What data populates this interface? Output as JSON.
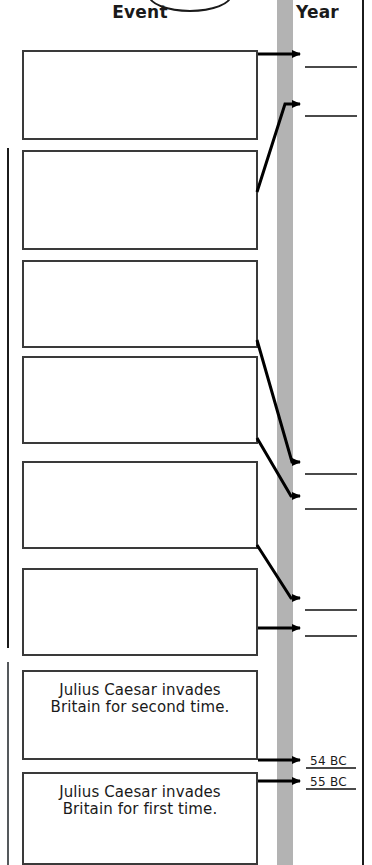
{
  "header": {
    "event_label": "Event",
    "year_label": "Year",
    "oval_icon": "oval-outline-icon"
  },
  "timeline": {
    "bar_color": "#b3b3b3",
    "orientation": "vertical"
  },
  "events": [
    {
      "text": "",
      "top": 50,
      "height": 90,
      "filled": false
    },
    {
      "text": "",
      "top": 150,
      "height": 100,
      "filled": false
    },
    {
      "text": "",
      "top": 260,
      "height": 88,
      "filled": false
    },
    {
      "text": "",
      "top": 356,
      "height": 88,
      "filled": false
    },
    {
      "text": "",
      "top": 461,
      "height": 88,
      "filled": false
    },
    {
      "text": "",
      "top": 568,
      "height": 88,
      "filled": false
    },
    {
      "text": "Julius Caesar invades\nBritain for second time.",
      "top": 670,
      "height": 90,
      "filled": true
    },
    {
      "text": "Julius Caesar invades\nBritain for first time.",
      "top": 772,
      "height": 93,
      "filled": true
    }
  ],
  "year_entries": [
    {
      "value": "",
      "line_top": 66,
      "blank": true
    },
    {
      "value": "",
      "line_top": 115,
      "blank": true
    },
    {
      "value": "",
      "line_top": 473,
      "blank": true
    },
    {
      "value": "",
      "line_top": 508,
      "blank": true
    },
    {
      "value": "",
      "line_top": 609,
      "blank": true
    },
    {
      "value": "",
      "line_top": 635,
      "blank": true
    },
    {
      "value": "54 BC",
      "line_top": 767,
      "blank": false
    },
    {
      "value": "55 BC",
      "line_top": 788,
      "blank": false
    }
  ],
  "connectors": [
    {
      "from_box": 1,
      "type": "horizontal",
      "arrow": "arrow-right-icon"
    },
    {
      "from_box": 2,
      "type": "diagonal-up",
      "arrow": "arrow-right-icon"
    },
    {
      "from_box": 3,
      "type": "diagonal-down",
      "arrow": "arrow-right-icon"
    },
    {
      "from_box": 4,
      "type": "diagonal-down",
      "arrow": "arrow-right-icon"
    },
    {
      "from_box": 5,
      "type": "diagonal-down",
      "arrow": "arrow-right-icon"
    },
    {
      "from_box": 6,
      "type": "horizontal",
      "arrow": "arrow-right-icon"
    },
    {
      "from_box": 7,
      "type": "horizontal",
      "arrow": "arrow-right-icon"
    },
    {
      "from_box": 8,
      "type": "horizontal",
      "arrow": "arrow-right-icon"
    }
  ]
}
